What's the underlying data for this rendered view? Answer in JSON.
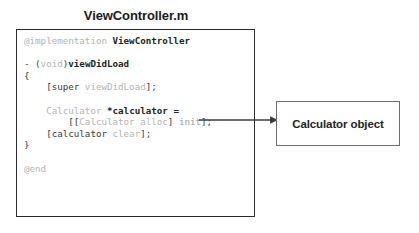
{
  "diagram": {
    "title": "ViewController.m",
    "code_box": {
      "language": "objective-c",
      "lines": [
        {
          "id": "line-implementation",
          "segments": [
            {
              "text": "@implementation ",
              "style": "dim"
            },
            {
              "text": "ViewController",
              "style": "dark"
            }
          ]
        },
        {
          "id": "line-blank-1",
          "segments": []
        },
        {
          "id": "line-method-signature",
          "segments": [
            {
              "text": "- (",
              "style": "plain"
            },
            {
              "text": "void",
              "style": "dim"
            },
            {
              "text": ")",
              "style": "plain"
            },
            {
              "text": "viewDidLoad",
              "style": "dark"
            }
          ]
        },
        {
          "id": "line-open-brace",
          "segments": [
            {
              "text": "{",
              "style": "plain"
            }
          ]
        },
        {
          "id": "line-super-viewdidload",
          "segments": [
            {
              "text": "    [super ",
              "style": "plain"
            },
            {
              "text": "viewDidLoad",
              "style": "dim"
            },
            {
              "text": "];",
              "style": "plain"
            }
          ]
        },
        {
          "id": "line-blank-2",
          "segments": []
        },
        {
          "id": "line-calculator-declaration",
          "segments": [
            {
              "text": "    ",
              "style": "plain"
            },
            {
              "text": "Calculator ",
              "style": "dim"
            },
            {
              "text": "*calculator =",
              "style": "dark"
            }
          ]
        },
        {
          "id": "line-calculator-alloc-init",
          "segments": [
            {
              "text": "        [[",
              "style": "plain"
            },
            {
              "text": "Calculator alloc",
              "style": "dim"
            },
            {
              "text": "] ",
              "style": "plain"
            },
            {
              "text": "init",
              "style": "mid"
            },
            {
              "text": "];",
              "style": "plain"
            }
          ]
        },
        {
          "id": "line-calculator-clear",
          "segments": [
            {
              "text": "    [calculator ",
              "style": "plain"
            },
            {
              "text": "clear",
              "style": "dim"
            },
            {
              "text": "];",
              "style": "plain"
            }
          ]
        },
        {
          "id": "line-close-brace",
          "segments": [
            {
              "text": "}",
              "style": "plain"
            }
          ]
        },
        {
          "id": "line-blank-3",
          "segments": []
        },
        {
          "id": "line-end",
          "segments": [
            {
              "text": "@end",
              "style": "dim"
            }
          ]
        }
      ]
    },
    "connector": {
      "name": "arrow-calculator-to-object",
      "direction": "right",
      "from": "line-calculator-declaration",
      "to": "object-box"
    },
    "object_box": {
      "label": "Calculator object"
    },
    "colors": {
      "code_border": "#2b2b2b",
      "object_border": "#6e6e6e",
      "text_dark": "#232323",
      "text_plain": "#3a3a3a",
      "text_dim": "#b4b4b4",
      "arrow": "#3a3a3a",
      "background": "#ffffff"
    }
  }
}
